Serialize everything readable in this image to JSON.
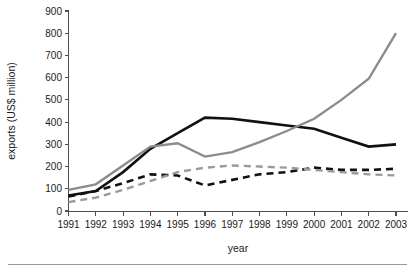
{
  "chart_data": {
    "type": "line",
    "title": "",
    "xlabel": "year",
    "ylabel": "exports (US$ million)",
    "x": [
      1991,
      1992,
      1993,
      1994,
      1995,
      1996,
      1997,
      1998,
      1999,
      2000,
      2001,
      2002,
      2003
    ],
    "categories": [
      "1991",
      "1992",
      "1993",
      "1994",
      "1995",
      "1996",
      "1997",
      "1998",
      "1999",
      "2000",
      "2001",
      "2002",
      "2003"
    ],
    "xlim": [
      1991,
      2003
    ],
    "ylim": [
      0,
      900
    ],
    "yticks": [
      0,
      100,
      200,
      300,
      400,
      500,
      600,
      700,
      800,
      900
    ],
    "ytick_labels": [
      "0",
      "100",
      "200",
      "300",
      "400",
      "500",
      "600",
      "700",
      "800",
      "900"
    ],
    "grid": false,
    "legend": "none",
    "series": [
      {
        "name": "series-black-solid",
        "color": "#111111",
        "style": "solid",
        "width": 2.6,
        "values": [
          70,
          90,
          175,
          280,
          350,
          420,
          415,
          400,
          385,
          370,
          330,
          290,
          300
        ]
      },
      {
        "name": "series-grey-solid",
        "color": "#8c8c8c",
        "style": "solid",
        "width": 2.4,
        "values": [
          95,
          120,
          205,
          290,
          305,
          245,
          265,
          310,
          360,
          415,
          500,
          595,
          800
        ]
      },
      {
        "name": "series-black-dashed",
        "color": "#111111",
        "style": "dashed",
        "width": 2.6,
        "values": [
          65,
          90,
          125,
          165,
          160,
          115,
          140,
          165,
          175,
          195,
          185,
          185,
          190
        ]
      },
      {
        "name": "series-grey-dashed",
        "color": "#9a9a9a",
        "style": "dashed",
        "width": 2.4,
        "values": [
          40,
          60,
          95,
          135,
          175,
          195,
          205,
          200,
          195,
          185,
          175,
          165,
          160
        ]
      }
    ]
  },
  "axis": {
    "y_title": "exports (US$ million)",
    "x_title": "year"
  }
}
